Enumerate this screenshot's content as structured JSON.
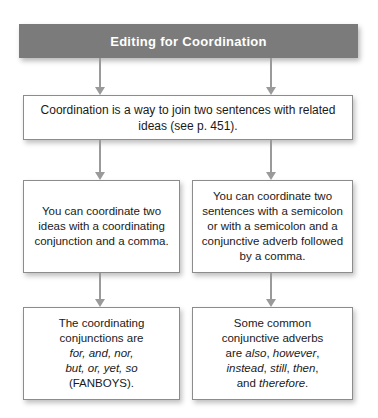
{
  "banner": {
    "title": "Editing for Coordination"
  },
  "boxes": {
    "intro": "Coordination is a way to join two sentences with related ideas (see p. 451).",
    "mid_left": "You can coordinate two ideas with a coordinating conjunction and a comma.",
    "mid_right": "You can coordinate two sentences with a semicolon or with a semicolon and a conjunctive adverb followed by a comma.",
    "bottom_left_html": "The coordinating<br>conjunctions are<br><em>for, and, nor,</em><br><em>but, or, yet, so</em><br>(FANBOYS).",
    "bottom_right_html": "Some common<br>conjunctive adverbs<br>are <em>also</em>, <em>however</em>,<br><em>instead</em>, <em>still</em>, <em>then</em>,<br>and <em>therefore</em>."
  },
  "colors": {
    "banner_background": "#7b7b7b",
    "banner_text": "#ffffff",
    "box_border": "#8c8c8c",
    "box_background": "#ffffff",
    "body_text": "#1a1a1a",
    "arrow": "#9a9a9a",
    "page_background": "#ffffff"
  }
}
